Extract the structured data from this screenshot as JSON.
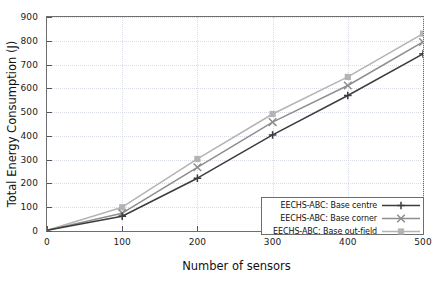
{
  "chart_data": {
    "type": "line",
    "title": "",
    "xlabel": "Number of sensors",
    "ylabel": "Total Energy Consumption (J)",
    "x": [
      0,
      100,
      200,
      300,
      400,
      500
    ],
    "xlim": [
      0,
      500
    ],
    "ylim": [
      0,
      900
    ],
    "xticks": [
      "0",
      "100",
      "200",
      "300",
      "400",
      "500"
    ],
    "yticks": [
      "0",
      "100",
      "200",
      "300",
      "400",
      "500",
      "600",
      "700",
      "800",
      "900"
    ],
    "grid": true,
    "legend_position": "lower-right",
    "series": [
      {
        "name": "EECHS-ABC: Base centre",
        "values": [
          3,
          62,
          222,
          404,
          570,
          745
        ],
        "color": "#3c3c3c",
        "marker": "plus-marker"
      },
      {
        "name": "EECHS-ABC: Base corner",
        "values": [
          3,
          75,
          268,
          458,
          612,
          795
        ],
        "color": "#8e8e8e",
        "marker": "cross-marker"
      },
      {
        "name": "EECHS-ABC: Base out-field",
        "values": [
          3,
          100,
          303,
          492,
          648,
          830
        ],
        "color": "#b4b4b4",
        "marker": "square-marker"
      }
    ]
  }
}
